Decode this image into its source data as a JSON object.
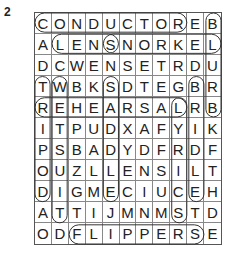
{
  "puzzle_number": "2",
  "grid": [
    [
      "C",
      "O",
      "N",
      "D",
      "U",
      "C",
      "T",
      "O",
      "R",
      "E",
      "B"
    ],
    [
      "A",
      "L",
      "E",
      "N",
      "S",
      "N",
      "O",
      "R",
      "K",
      "E",
      "L"
    ],
    [
      "D",
      "C",
      "W",
      "E",
      "N",
      "S",
      "E",
      "T",
      "R",
      "D",
      "U"
    ],
    [
      "T",
      "W",
      "B",
      "K",
      "S",
      "D",
      "T",
      "E",
      "G",
      "B",
      "R"
    ],
    [
      "R",
      "E",
      "H",
      "E",
      "A",
      "R",
      "S",
      "A",
      "L",
      "R",
      "B"
    ],
    [
      "I",
      "T",
      "P",
      "U",
      "D",
      "X",
      "A",
      "F",
      "Y",
      "I",
      "K"
    ],
    [
      "P",
      "S",
      "B",
      "A",
      "D",
      "Y",
      "D",
      "F",
      "R",
      "D",
      "F"
    ],
    [
      "O",
      "U",
      "Z",
      "L",
      "L",
      "E",
      "N",
      "S",
      "I",
      "L",
      "T"
    ],
    [
      "D",
      "I",
      "G",
      "M",
      "E",
      "C",
      "I",
      "U",
      "C",
      "E",
      "H"
    ],
    [
      "A",
      "T",
      "T",
      "I",
      "J",
      "M",
      "N",
      "M",
      "S",
      "T",
      "D"
    ],
    [
      "O",
      "D",
      "F",
      "L",
      "I",
      "P",
      "P",
      "E",
      "R",
      "S",
      "E"
    ]
  ],
  "found_words": [
    {
      "word": "CONDUCTOR",
      "start": [
        0,
        0
      ],
      "end": [
        0,
        8
      ]
    },
    {
      "word": "LENS",
      "start": [
        1,
        1
      ],
      "end": [
        1,
        4
      ]
    },
    {
      "word": "SNORKEL",
      "start": [
        1,
        4
      ],
      "end": [
        1,
        10
      ]
    },
    {
      "word": "REHEARSAL",
      "start": [
        4,
        0
      ],
      "end": [
        4,
        8
      ]
    },
    {
      "word": "FLIPPERS",
      "start": [
        10,
        2
      ],
      "end": [
        10,
        9
      ]
    },
    {
      "word": "TRIPOD",
      "start": [
        3,
        0
      ],
      "end": [
        8,
        0
      ]
    },
    {
      "word": "WETSUIT",
      "start": [
        3,
        1
      ],
      "end": [
        9,
        1
      ]
    },
    {
      "word": "SADDLE",
      "start": [
        3,
        4
      ],
      "end": [
        8,
        4
      ]
    },
    {
      "word": "LYRICS",
      "start": [
        4,
        8
      ],
      "end": [
        9,
        8
      ]
    },
    {
      "word": "BRIDLE",
      "start": [
        3,
        9
      ],
      "end": [
        8,
        9
      ]
    },
    {
      "word": "BLURB",
      "start": [
        0,
        10
      ],
      "end": [
        4,
        10
      ]
    }
  ]
}
